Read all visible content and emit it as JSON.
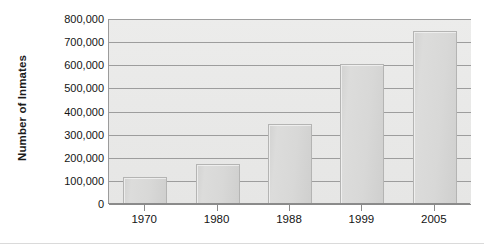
{
  "chart_data": {
    "type": "bar",
    "title": "",
    "xlabel": "",
    "ylabel": "Number of Inmates",
    "categories": [
      "1970",
      "1980",
      "1988",
      "1999",
      "2005"
    ],
    "values": [
      115000,
      175000,
      345000,
      607000,
      750000
    ],
    "ylim": [
      0,
      800000
    ],
    "ytick_values": [
      0,
      100000,
      200000,
      300000,
      400000,
      500000,
      600000,
      700000,
      800000
    ],
    "ytick_labels": [
      "0",
      "100,000",
      "200,000",
      "300,000",
      "400,000",
      "500,000",
      "600,000",
      "700,000",
      "800,000"
    ],
    "grid": true,
    "legend": null,
    "legend_position": "none",
    "colors": {
      "bar_fill": "#d8d8d7",
      "bar_border": "#b4b4b3",
      "plot_background": "#eaeae9",
      "gridline": "#9d9d9d",
      "axis": "#8b8b8b",
      "text": "#141414"
    }
  }
}
